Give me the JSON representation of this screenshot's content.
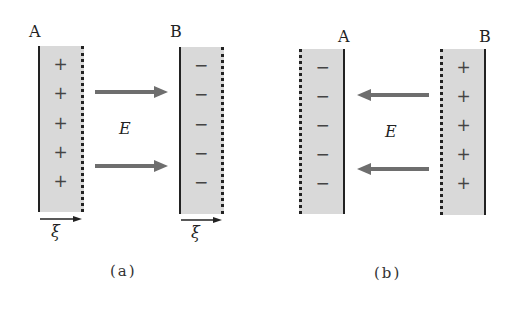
{
  "panels": [
    {
      "caption": "(a)",
      "field_label": "E",
      "field_direction": "A-to-B",
      "plate_a": {
        "label": "A",
        "signs": [
          "+",
          "+",
          "+",
          "+",
          "+"
        ]
      },
      "plate_b": {
        "label": "B",
        "signs": [
          "−",
          "−",
          "−",
          "−",
          "−"
        ]
      },
      "xi_labels": [
        "ξ",
        "ξ"
      ]
    },
    {
      "caption": "(b)",
      "field_label": "E",
      "field_direction": "B-to-A",
      "plate_a": {
        "label": "A",
        "signs": [
          "−",
          "−",
          "−",
          "−",
          "−"
        ]
      },
      "plate_b": {
        "label": "B",
        "signs": [
          "+",
          "+",
          "+",
          "+",
          "+"
        ]
      }
    }
  ],
  "colors": {
    "plate_fill": "#d9d9d9",
    "arrow": "#6e6e6e",
    "line": "#222222"
  }
}
